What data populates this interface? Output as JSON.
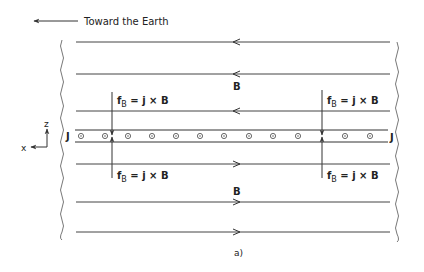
{
  "header": {
    "direction_label": "Toward the Earth",
    "direction_arrow": "arrow-left"
  },
  "field": {
    "label_top": "B",
    "label_bottom": "B",
    "top_lines_direction": "left",
    "bottom_lines_direction": "right",
    "top_line_y": [
      42,
      74,
      111
    ],
    "bottom_line_y": [
      164,
      202,
      232
    ]
  },
  "sheet": {
    "label_left": "J",
    "label_right": "J",
    "current_symbol": "out-of-page (circle-dot)",
    "dot_x": [
      81,
      105,
      128,
      152,
      176,
      200,
      224,
      249,
      273,
      298,
      345,
      370
    ]
  },
  "forces": {
    "top_left": {
      "f": "f",
      "sub": "B",
      "eq": " = j × B"
    },
    "top_right": {
      "f": "f",
      "sub": "B",
      "eq": " = j × B"
    },
    "bottom_left": {
      "f": "f",
      "sub": "B",
      "eq": " = j × B"
    },
    "bottom_right": {
      "f": "f",
      "sub": "B",
      "eq": " = j × B"
    }
  },
  "axes": {
    "vertical": "z",
    "horizontal": "x"
  },
  "caption": "a)",
  "colors": {
    "line": "#444444",
    "text": "#222222",
    "background": "#ffffff"
  }
}
